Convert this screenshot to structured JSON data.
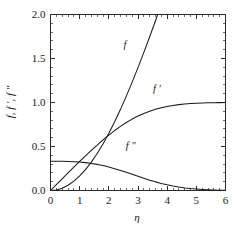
{
  "figure": {
    "background_color": "#ffffff",
    "line_color": "#1a1a1a",
    "axis_color": "#2b2b2b"
  },
  "chart_data": {
    "type": "line",
    "title": "",
    "subtitle": "",
    "xlabel": "η",
    "ylabel": "f, f ′, f ″",
    "xlim": [
      0,
      6
    ],
    "ylim": [
      0,
      2.0
    ],
    "grid": false,
    "legend_position": "inline-curve-labels",
    "x_major_ticks": [
      0,
      1,
      2,
      3,
      4,
      5,
      6
    ],
    "x_major_tick_labels": [
      "0",
      "1",
      "2",
      "3",
      "4",
      "5",
      "6"
    ],
    "x_minor_tick_step": 0.2,
    "y_major_ticks": [
      0.0,
      0.5,
      1.0,
      1.5,
      2.0
    ],
    "y_major_tick_labels": [
      "0.0",
      "0.5",
      "1.0",
      "1.5",
      "2.0"
    ],
    "y_minor_tick_step": 0.1,
    "tick_direction": "in",
    "annotations": [
      {
        "text": "f",
        "x": 2.55,
        "y": 1.62
      },
      {
        "text": "f ′",
        "x": 3.65,
        "y": 1.12
      },
      {
        "text": "f ″",
        "x": 2.75,
        "y": 0.47
      }
    ],
    "x": [
      0,
      0.2,
      0.4,
      0.6,
      0.8,
      1.0,
      1.2,
      1.4,
      1.6,
      1.8,
      2.0,
      2.2,
      2.4,
      2.6,
      2.8,
      3.0,
      3.2,
      3.4,
      3.6,
      3.8,
      4.0,
      4.2,
      4.4,
      4.6,
      4.8,
      5.0,
      5.2,
      5.4,
      5.6,
      5.8,
      6.0
    ],
    "series": [
      {
        "name": "f",
        "label": "f",
        "values": [
          0.0,
          0.00664,
          0.02656,
          0.05974,
          0.10611,
          0.16557,
          0.23795,
          0.32298,
          0.42032,
          0.52952,
          0.65003,
          0.7812,
          0.9223,
          1.07252,
          1.23099,
          1.39682,
          1.56911,
          1.74696,
          1.92954,
          2.11605,
          2.30576,
          2.49806,
          2.69238,
          2.88826,
          3.08534,
          3.28329,
          3.48189,
          3.68094,
          3.88031,
          4.0799,
          4.27964
        ]
      },
      {
        "name": "f'",
        "label": "f ′",
        "values": [
          0.0,
          0.06641,
          0.13277,
          0.19894,
          0.26471,
          0.32979,
          0.39378,
          0.45627,
          0.51676,
          0.57477,
          0.62977,
          0.68132,
          0.72899,
          0.77246,
          0.81152,
          0.84605,
          0.87609,
          0.90177,
          0.92333,
          0.94112,
          0.95552,
          0.96696,
          0.97587,
          0.98269,
          0.98779,
          0.99155,
          0.99425,
          0.99616,
          0.99748,
          0.99838,
          0.99898
        ]
      },
      {
        "name": "f''",
        "label": "f ″",
        "values": [
          0.33206,
          0.33199,
          0.33147,
          0.33008,
          0.32739,
          0.32301,
          0.31659,
          0.30787,
          0.29667,
          0.28293,
          0.26675,
          0.24835,
          0.22809,
          0.20646,
          0.18401,
          0.16136,
          0.13913,
          0.11788,
          0.09809,
          0.08013,
          0.06424,
          0.05052,
          0.03897,
          0.02948,
          0.02187,
          0.01591,
          0.01134,
          0.00793,
          0.00543,
          0.00365,
          0.0024
        ]
      }
    ]
  }
}
